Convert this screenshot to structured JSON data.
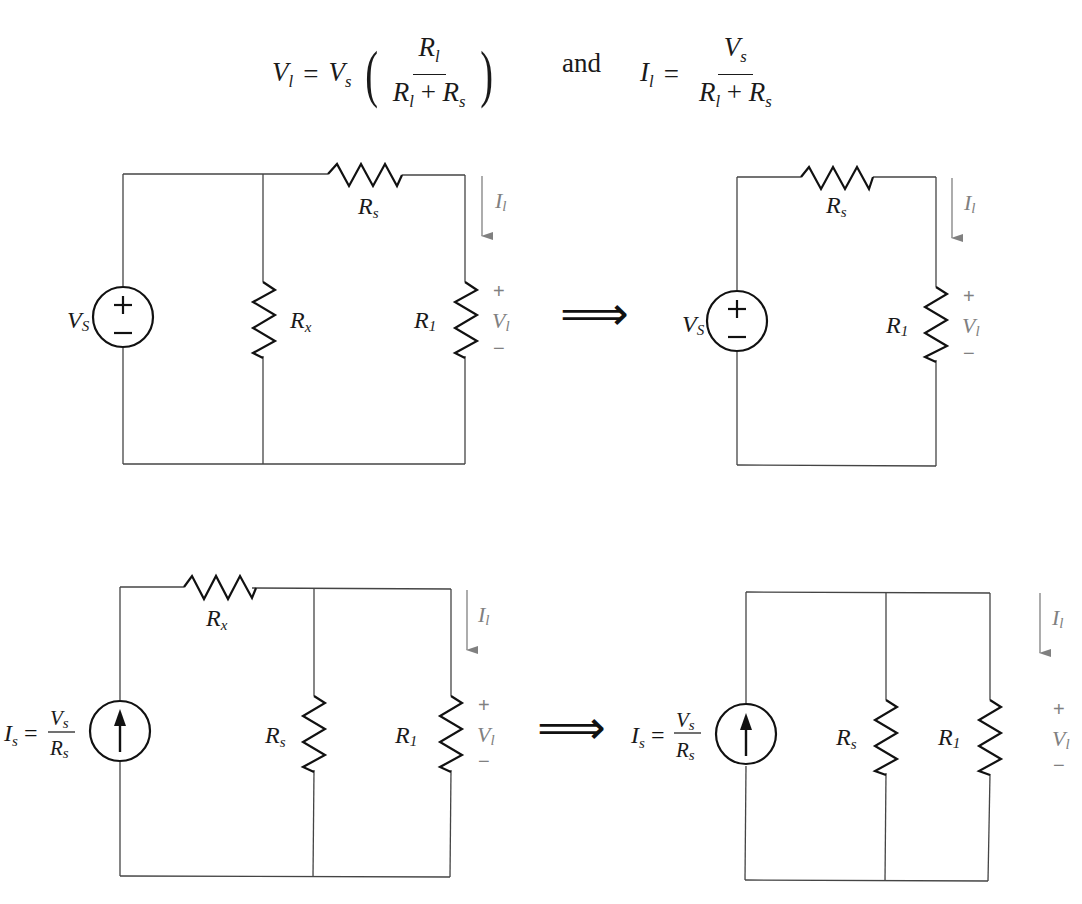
{
  "equations": {
    "voltage": {
      "lhs": "V",
      "lhs_sub": "l",
      "equals": "=",
      "factor": "V",
      "factor_sub": "s",
      "numerator": "R",
      "numerator_sub": "l",
      "denominator_a": "R",
      "denominator_a_sub": "l",
      "plus": "+",
      "denominator_b": "R",
      "denominator_b_sub": "s"
    },
    "connector": "and",
    "current": {
      "lhs": "I",
      "lhs_sub": "l",
      "equals": "=",
      "numerator": "V",
      "numerator_sub": "s",
      "denominator_a": "R",
      "denominator_a_sub": "l",
      "plus": "+",
      "denominator_b": "R",
      "denominator_b_sub": "s"
    }
  },
  "circuits": {
    "top_left": {
      "source_label": "V",
      "source_label_sub": "S",
      "source_plus": "+",
      "source_minus": "−",
      "parallel_resistor": "R",
      "parallel_resistor_sub": "x",
      "series_resistor": "R",
      "series_resistor_sub": "s",
      "load_resistor": "R",
      "load_resistor_sub": "1",
      "current_label": "I",
      "current_label_sub": "l",
      "voltage_label": "V",
      "voltage_label_sub": "l",
      "voltage_plus": "+",
      "voltage_minus": "−"
    },
    "top_right": {
      "source_label": "V",
      "source_label_sub": "S",
      "source_plus": "+",
      "source_minus": "−",
      "series_resistor": "R",
      "series_resistor_sub": "s",
      "load_resistor": "R",
      "load_resistor_sub": "1",
      "current_label": "I",
      "current_label_sub": "l",
      "voltage_label": "V",
      "voltage_label_sub": "l",
      "voltage_plus": "+",
      "voltage_minus": "−"
    },
    "bottom_left": {
      "source_eq_lhs": "I",
      "source_eq_lhs_sub": "s",
      "source_eq_equals": "=",
      "source_eq_num": "V",
      "source_eq_num_sub": "s",
      "source_eq_den": "R",
      "source_eq_den_sub": "s",
      "series_resistor": "R",
      "series_resistor_sub": "x",
      "parallel_resistor": "R",
      "parallel_resistor_sub": "s",
      "load_resistor": "R",
      "load_resistor_sub": "1",
      "current_label": "I",
      "current_label_sub": "l",
      "voltage_label": "V",
      "voltage_label_sub": "l",
      "voltage_plus": "+",
      "voltage_minus": "−"
    },
    "bottom_right": {
      "source_eq_lhs": "I",
      "source_eq_lhs_sub": "s",
      "source_eq_equals": "=",
      "source_eq_num": "V",
      "source_eq_num_sub": "s",
      "source_eq_den": "R",
      "source_eq_den_sub": "s",
      "parallel_resistor": "R",
      "parallel_resistor_sub": "s",
      "load_resistor": "R",
      "load_resistor_sub": "1",
      "current_label": "I",
      "current_label_sub": "l",
      "voltage_label": "V",
      "voltage_label_sub": "l",
      "voltage_plus": "+",
      "voltage_minus": "−"
    }
  },
  "arrows": {
    "top": "⟹",
    "bottom": "⟹"
  },
  "colors": {
    "wire": "#444444",
    "component": "#111111",
    "annotation": "#808080",
    "background": "#ffffff"
  }
}
